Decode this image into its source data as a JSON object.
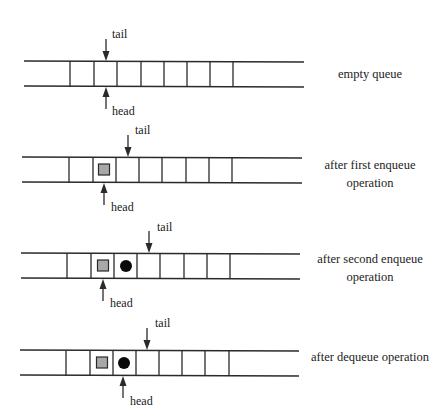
{
  "diagram": {
    "colors": {
      "line": "#2a2a2a",
      "element_square_fill": "#a8a8a8",
      "element_square_stroke": "#2a2a2a",
      "element_circle_fill": "#0a0a0a",
      "background": "#ffffff"
    },
    "pointer_labels": {
      "tail": "tail",
      "head": "head"
    },
    "rows": [
      {
        "id": "empty",
        "caption_lines": [
          "empty queue"
        ],
        "top_y": 61,
        "bottom_y": 86,
        "x_start": 24,
        "x_end": 304,
        "cells": [
          70,
          94,
          117,
          141,
          164,
          187,
          210,
          233
        ],
        "elements": [],
        "tail": {
          "x": 106,
          "label_x": 112,
          "label_y": 38
        },
        "head": {
          "x": 106,
          "label_x": 112,
          "label_y": 115
        },
        "caption_x": 370,
        "caption_y": 78
      },
      {
        "id": "first-enqueue",
        "caption_lines": [
          "after first enqueue",
          "operation"
        ],
        "top_y": 157,
        "bottom_y": 182,
        "x_start": 22,
        "x_end": 302,
        "cells": [
          69,
          93,
          116,
          139,
          162,
          186,
          209,
          232
        ],
        "elements": [
          {
            "type": "square",
            "cx": 104,
            "cy": 170
          }
        ],
        "tail": {
          "x": 128,
          "label_x": 135,
          "label_y": 134
        },
        "head": {
          "x": 104,
          "label_x": 111,
          "label_y": 211
        },
        "caption_x": 370,
        "caption_y": 169
      },
      {
        "id": "second-enqueue",
        "caption_lines": [
          "after second enqueue",
          "operation"
        ],
        "top_y": 253,
        "bottom_y": 278,
        "x_start": 21,
        "x_end": 300,
        "cells": [
          67,
          91,
          114,
          137,
          160,
          184,
          207,
          230
        ],
        "elements": [
          {
            "type": "square",
            "cx": 103,
            "cy": 266
          },
          {
            "type": "circle",
            "cx": 126,
            "cy": 266
          }
        ],
        "tail": {
          "x": 149,
          "label_x": 157,
          "label_y": 231
        },
        "head": {
          "x": 103,
          "label_x": 110,
          "label_y": 307
        },
        "caption_x": 370,
        "caption_y": 263
      },
      {
        "id": "dequeue",
        "caption_lines": [
          "after dequeue operation"
        ],
        "top_y": 350,
        "bottom_y": 375,
        "x_start": 20,
        "x_end": 299,
        "cells": [
          66,
          90,
          113,
          136,
          159,
          182,
          205,
          229
        ],
        "elements": [
          {
            "type": "square",
            "cx": 102,
            "cy": 363
          },
          {
            "type": "circle",
            "cx": 124,
            "cy": 363
          }
        ],
        "tail": {
          "x": 147,
          "label_x": 155,
          "label_y": 327
        },
        "head": {
          "x": 123,
          "label_x": 130,
          "label_y": 405
        },
        "caption_x": 370,
        "caption_y": 361
      }
    ]
  }
}
